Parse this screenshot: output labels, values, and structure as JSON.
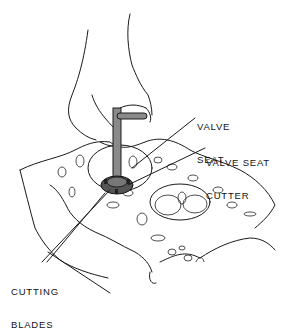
{
  "diagram": {
    "labels": [
      {
        "id": "valve-seat",
        "lines": [
          "VALVE",
          "SEAT"
        ]
      },
      {
        "id": "valve-seat-cutter",
        "lines": [
          "VALVE SEAT",
          "CUTTER"
        ]
      },
      {
        "id": "cutting-blades",
        "lines": [
          "CUTTING",
          "BLADES"
        ]
      }
    ],
    "colors": {
      "line": "#1a1a1a",
      "background": "#ffffff",
      "tool_shaft": "#8a8a8a"
    }
  }
}
